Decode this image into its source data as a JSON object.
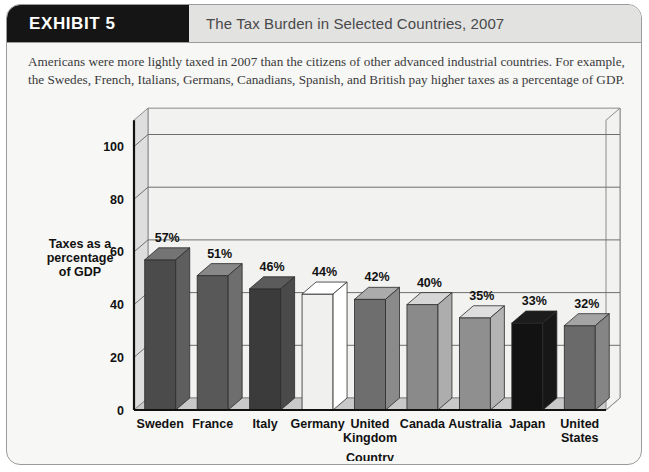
{
  "card": {
    "badge_label": "EXHIBIT 5",
    "title": "The Tax Burden in Selected Countries, 2007",
    "caption": "Americans were more lightly taxed in 2007 than the citizens of other advanced industrial countries. For example, the Swedes, French, Italians, Germans, Canadians, Spanish, and British pay higher taxes as a percentage of GDP."
  },
  "chart_data": {
    "type": "bar",
    "title": "The Tax Burden in Selected Countries, 2007",
    "subtitle": "",
    "xlabel": "Country",
    "ylabel": "Taxes as a percentage of GDP",
    "ylim": [
      0,
      110
    ],
    "yticks": [
      0,
      20,
      40,
      60,
      80,
      100
    ],
    "ytick_labels": [
      "0",
      "20",
      "40",
      "60",
      "80",
      "100"
    ],
    "grid": true,
    "legend": "none",
    "three_d": true,
    "categories": [
      "Sweden",
      "France",
      "Italy",
      "Germany",
      "United Kingdom",
      "Canada",
      "Australia",
      "Japan",
      "United States"
    ],
    "category_lines": [
      [
        "Sweden"
      ],
      [
        "France"
      ],
      [
        "Italy"
      ],
      [
        "Germany"
      ],
      [
        "United",
        "Kingdom"
      ],
      [
        "Canada"
      ],
      [
        "Australia"
      ],
      [
        "Japan"
      ],
      [
        "United",
        "States"
      ]
    ],
    "values": [
      57,
      51,
      46,
      44,
      42,
      40,
      35,
      33,
      32
    ],
    "data_labels": [
      "57%",
      "51%",
      "46%",
      "44%",
      "42%",
      "40%",
      "35%",
      "33%",
      "32%"
    ],
    "bar_colors": [
      "#4b4b4b",
      "#585858",
      "#3b3b3b",
      "#f0f0ee",
      "#6e6e6e",
      "#8a8a8a",
      "#8f8f8f",
      "#121212",
      "#6a6a6a"
    ]
  },
  "palette": {
    "card_background": "#f7f7f5",
    "card_border": "#9b9b9b",
    "header_background": "#e2e2e0",
    "badge_background": "#151515",
    "title_text": "#49494b",
    "plot_background": "#f2f2f0",
    "wall_shade": "#dedede",
    "floor_shade": "#c9c9c9",
    "gridline": "#6f6f6f",
    "axis_line": "#111111"
  }
}
